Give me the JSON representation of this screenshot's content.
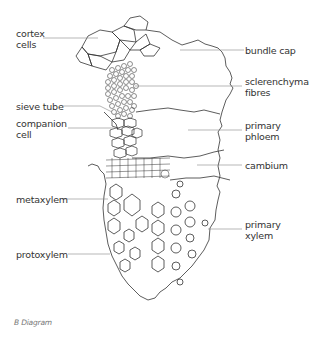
{
  "figure": {
    "caption": "B Diagram",
    "labels": {
      "cortex_cells": [
        "cortex",
        "cells"
      ],
      "bundle_cap": "bundle cap",
      "sclerenchyma_fibres": [
        "sclerenchyma",
        "fibres"
      ],
      "sieve_tube": "sieve tube",
      "companion_cell": [
        "companion",
        "cell"
      ],
      "primary_phloem": [
        "primary",
        "phloem"
      ],
      "cambium": "cambium",
      "metaxylem": "metaxylem",
      "primary_xylem": [
        "primary",
        "xylem"
      ],
      "protoxylem": "protoxylem"
    },
    "colors": {
      "ink": "#333333",
      "leader": "#888888",
      "background": "#ffffff"
    }
  }
}
